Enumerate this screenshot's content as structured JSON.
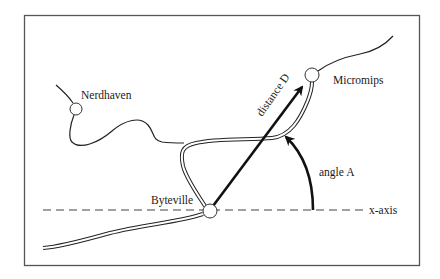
{
  "diagram": {
    "towns": [
      {
        "name": "Nerdhaven",
        "x": 76,
        "y": 109
      },
      {
        "name": "Byteville",
        "x": 210,
        "y": 211
      },
      {
        "name": "Micromips",
        "x": 312,
        "y": 75
      }
    ],
    "labels": {
      "distance": "distance D",
      "angle": "angle A",
      "axis": "x-axis"
    },
    "colors": {
      "frame": "#555555",
      "line": "#111111",
      "background": "#ffffff"
    }
  }
}
